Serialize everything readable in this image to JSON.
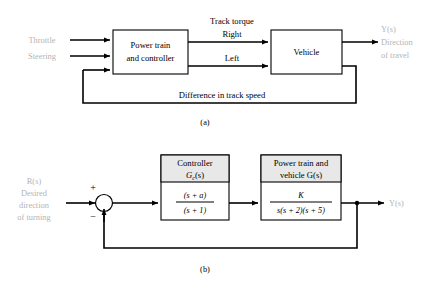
{
  "figure": {
    "caption_a": "(a)",
    "caption_b": "(b)"
  },
  "diagram_a": {
    "inputs": [
      {
        "label": "Throttle"
      },
      {
        "label": "Steering"
      }
    ],
    "blocks": [
      {
        "name": "power-train-controller",
        "line1": "Power train",
        "line2": "and controller"
      },
      {
        "name": "vehicle",
        "line1": "Vehicle"
      }
    ],
    "signal_group_label": "Track torque",
    "signal_right": "Right",
    "signal_left": "Left",
    "feedback_label": "Difference in track speed",
    "output": {
      "symbol": "Y(s)",
      "line1": "Direction",
      "line2": "of travel"
    }
  },
  "diagram_b": {
    "input": {
      "symbol": "R(s)",
      "line1": "Desired",
      "line2": "direction",
      "line3": "of turning"
    },
    "summing_junction": {
      "plus": "+",
      "minus": "−"
    },
    "controller_block": {
      "title_line1": "Controller",
      "title_line2": "G",
      "title_sub": "c",
      "title_line2_tail": "(s)",
      "numerator": "(s + a)",
      "denominator": "(s + 1)"
    },
    "plant_block": {
      "title_line1": "Power train and",
      "title_line2": "vehicle G(s)",
      "numerator": "K",
      "denominator": "s(s + 2)(s + 5)"
    },
    "output": {
      "symbol": "Y(s)"
    }
  },
  "colors": {
    "line": "#000000",
    "block_fill": "#ffffff",
    "header_fill": "#e8e8e8",
    "faint_text": "#b4b4b4",
    "background": "#ffffff"
  }
}
